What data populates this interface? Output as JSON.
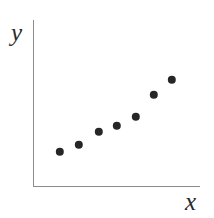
{
  "figure": {
    "background_color": "#ffffff",
    "width": 214,
    "height": 218
  },
  "axes": {
    "color": "#8c8c8c",
    "x_axis_name": "x-axis-line",
    "y_axis_name": "y-axis-line",
    "x_label": "x",
    "y_label": "y"
  },
  "chart_data": {
    "type": "scatter",
    "title": "",
    "subtitle": "",
    "xlabel": "x",
    "ylabel": "y",
    "grid": false,
    "legend": null,
    "tick_labels": {
      "x": [],
      "y": []
    },
    "xlim": [
      0,
      10
    ],
    "ylim": [
      0,
      10
    ],
    "marker": {
      "shape": "circle",
      "color": "#262626",
      "size_px": 8.4,
      "count": 7
    },
    "series": [
      {
        "name": "points",
        "color": "#262626",
        "x": [
          1.6,
          2.75,
          3.95,
          5.0,
          6.15,
          7.25,
          8.35
        ],
        "y": [
          2.05,
          2.45,
          3.25,
          3.65,
          4.2,
          5.55,
          6.35
        ],
        "pixel_points": [
          {
            "cx": 60,
            "cy": 152
          },
          {
            "cx": 79,
            "cy": 145
          },
          {
            "cx": 99,
            "cy": 132
          },
          {
            "cx": 117,
            "cy": 126
          },
          {
            "cx": 136,
            "cy": 117
          },
          {
            "cx": 154,
            "cy": 95
          },
          {
            "cx": 172,
            "cy": 80
          }
        ]
      }
    ]
  }
}
